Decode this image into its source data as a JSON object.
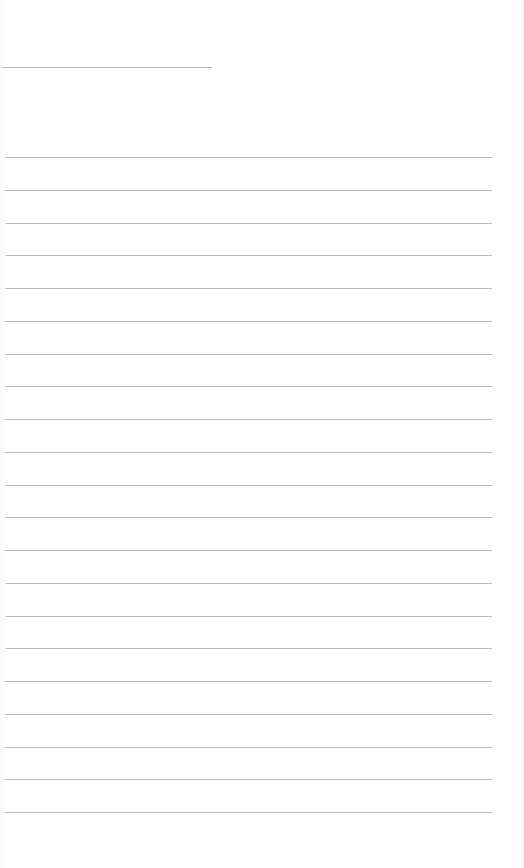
{
  "page": {
    "type": "blank lined notepad page",
    "background_color": "#ffffff",
    "line_color": "#b8b8b8"
  },
  "header_line": {
    "label": "",
    "top": 67,
    "width": 210
  },
  "ruled_lines": {
    "count": 21,
    "first_top": 157,
    "spacing": 32.75,
    "left": 5,
    "width": 487,
    "texts": [
      "",
      "",
      "",
      "",
      "",
      "",
      "",
      "",
      "",
      "",
      "",
      "",
      "",
      "",
      "",
      "",
      "",
      "",
      "",
      "",
      ""
    ]
  }
}
